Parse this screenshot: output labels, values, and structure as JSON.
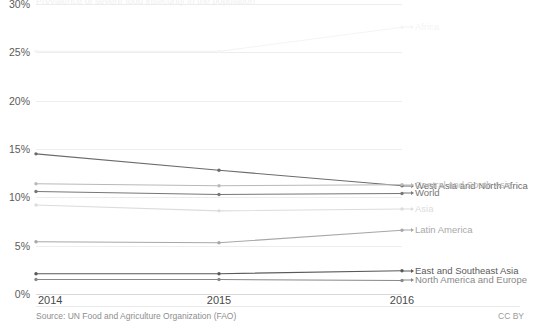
{
  "chart_data": {
    "type": "line",
    "title": "Prevalence of severe food insecurity in the population",
    "x": [
      2014,
      2015,
      2016
    ],
    "xlabel": "",
    "ylabel": "",
    "ylim": [
      0,
      30
    ],
    "yticks": [
      "0%",
      "5%",
      "10%",
      "15%",
      "20%",
      "25%",
      "30%"
    ],
    "ytick_values": [
      0,
      5,
      10,
      15,
      20,
      25,
      30
    ],
    "xticks": [
      "2014",
      "2015",
      "2016"
    ],
    "grid": true,
    "legend_position": "right-inline-end-labels",
    "series": [
      {
        "name": "Sub-Saharan Africa",
        "values": [
          30.9,
          31.4,
          33.3
        ],
        "color": "#f2f2f4"
      },
      {
        "name": "Africa",
        "values": [
          25.1,
          25.1,
          27.6
        ],
        "color": "#f4f4f6"
      },
      {
        "name": "West Asia and North Africa",
        "values": [
          14.5,
          12.8,
          11.2
        ],
        "color": "#6b6b6b"
      },
      {
        "name": "Central and South Asia",
        "values": [
          11.4,
          11.2,
          11.3
        ],
        "color": "#b9b9b9"
      },
      {
        "name": "World",
        "values": [
          10.6,
          10.3,
          10.4
        ],
        "color": "#777777"
      },
      {
        "name": "Asia",
        "values": [
          9.2,
          8.6,
          8.8
        ],
        "color": "#dcdcdc"
      },
      {
        "name": "Latin America",
        "values": [
          5.4,
          5.3,
          6.6
        ],
        "color": "#a8a8a8"
      },
      {
        "name": "East and Southeast Asia",
        "values": [
          2.1,
          2.1,
          2.4
        ],
        "color": "#5a5a5a"
      },
      {
        "name": "North America and Europe",
        "values": [
          1.5,
          1.5,
          1.4
        ],
        "color": "#888888"
      }
    ]
  },
  "footer": {
    "source": "Source: UN Food and Agriculture Organization (FAO)",
    "license": "CC BY"
  }
}
